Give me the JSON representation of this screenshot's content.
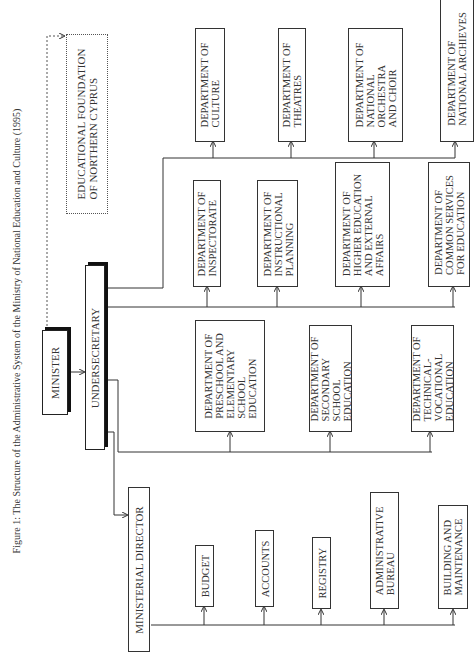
{
  "title": "Figure 1: The Structure of the Administrative System of the Ministry of National Education and Culture (1995)",
  "nodes": {
    "minister": "MINISTER",
    "foundation": "EDUCATIONAL FOUNDATION\nOF NORTHERN CYPRUS",
    "undersecretary": "UNDERSECRETARY",
    "ministerial_director": "MINISTERIAL DIRECTOR",
    "budget": "BUDGET",
    "accounts": "ACCOUNTS",
    "registry": "REGISTRY",
    "admin_bureau": "ADMINISTRATIVE\nBUREAU",
    "building": "BUILDING AND\nMAINTENANCE",
    "preschool": "DEPARTMENT OF\nPRESCHOOL AND\nELEMENTARY\nSCHOOL\nEDUCATION",
    "secondary": "DEPARTMENT OF\nSECONDARY\nSCHOOL\nEDUCATION",
    "technical": "DEPARTMENT OF\nTECHNICAL-\nVOCATIONAL\nEDUCATION",
    "inspectorate": "DEPARTMENT OF\nINSPECTORATE",
    "instructional": "DEPARTMENT OF\nINSTRUCTIONAL\nPLANNING",
    "higher_ed": "DEPARTMENT OF\nHIGHER EDUCATION\nAND EXTERNAL\nAFFAIRS",
    "common_services": "DEPARTMENT OF\nCOMMON SERVICES\nFOR EDUCATION",
    "culture": "DEPARTMENT OF\nCULTURE",
    "theatres": "DEPARTMENT OF\nTHEATRES",
    "orchestra": "DEPARTMENT OF\nNATIONAL\nORCHESTRA\nAND CHOIR",
    "archives": "DEPARTMENT OF\nNATIONAL ARCHIEVES"
  },
  "edges": [
    {
      "from": "minister",
      "to": "undersecretary",
      "style": "solid"
    },
    {
      "from": "minister",
      "to": "foundation",
      "style": "dashed"
    },
    {
      "from": "undersecretary",
      "to": "ministerial_director",
      "style": "solid"
    },
    {
      "from": "ministerial_director",
      "to": "budget",
      "style": "solid"
    },
    {
      "from": "ministerial_director",
      "to": "accounts",
      "style": "solid"
    },
    {
      "from": "ministerial_director",
      "to": "registry",
      "style": "solid"
    },
    {
      "from": "ministerial_director",
      "to": "admin_bureau",
      "style": "solid"
    },
    {
      "from": "ministerial_director",
      "to": "building",
      "style": "solid"
    },
    {
      "from": "undersecretary",
      "to": "preschool",
      "style": "solid"
    },
    {
      "from": "undersecretary",
      "to": "secondary",
      "style": "solid"
    },
    {
      "from": "undersecretary",
      "to": "technical",
      "style": "solid"
    },
    {
      "from": "undersecretary",
      "to": "inspectorate",
      "style": "solid"
    },
    {
      "from": "undersecretary",
      "to": "instructional",
      "style": "solid"
    },
    {
      "from": "undersecretary",
      "to": "higher_ed",
      "style": "solid"
    },
    {
      "from": "undersecretary",
      "to": "common_services",
      "style": "solid"
    },
    {
      "from": "undersecretary",
      "to": "culture",
      "style": "solid"
    },
    {
      "from": "undersecretary",
      "to": "theatres",
      "style": "solid"
    },
    {
      "from": "undersecretary",
      "to": "orchestra",
      "style": "solid"
    },
    {
      "from": "undersecretary",
      "to": "archives",
      "style": "solid"
    }
  ]
}
